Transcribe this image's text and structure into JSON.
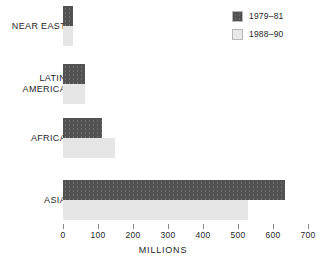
{
  "chart_data": {
    "type": "bar",
    "orientation": "horizontal",
    "title": "",
    "subtitle": "",
    "xlabel": "MILLIONS",
    "ylabel": "",
    "xlim": [
      0,
      700
    ],
    "xticks": [
      0,
      100,
      200,
      300,
      400,
      500,
      600,
      700
    ],
    "xtick_labels": [
      "0",
      "100",
      "200",
      "300",
      "400",
      "500",
      "600",
      "700"
    ],
    "grid": false,
    "legend_position": "top-right",
    "categories": [
      "NEAR EAST",
      "LATIN AMERICA",
      "AFRICA",
      "ASIA"
    ],
    "series": [
      {
        "name": "1979–81",
        "color": "#525252",
        "values": [
          28,
          63,
          111,
          634
        ]
      },
      {
        "name": "1988–90",
        "color": "#e6e6e6",
        "values": [
          28,
          64,
          148,
          529
        ]
      }
    ],
    "annotations": []
  },
  "legend": {
    "items": [
      {
        "label": "1979–81",
        "swatch": "dark-swatch"
      },
      {
        "label": "1988–90",
        "swatch": "light-swatch"
      }
    ]
  },
  "axis": {
    "title": "MILLIONS",
    "ticks": [
      {
        "value": 0,
        "label": "0"
      },
      {
        "value": 100,
        "label": "100"
      },
      {
        "value": 200,
        "label": "200"
      },
      {
        "value": 300,
        "label": "300"
      },
      {
        "value": 400,
        "label": "400"
      },
      {
        "value": 500,
        "label": "500"
      },
      {
        "value": 600,
        "label": "600"
      },
      {
        "value": 700,
        "label": "700"
      }
    ]
  },
  "rows": [
    {
      "label_line1": "NEAR EAST",
      "label_line2": ""
    },
    {
      "label_line1": "LATIN",
      "label_line2": "AMERICA"
    },
    {
      "label_line1": "AFRICA",
      "label_line2": ""
    },
    {
      "label_line1": "ASIA",
      "label_line2": ""
    }
  ]
}
